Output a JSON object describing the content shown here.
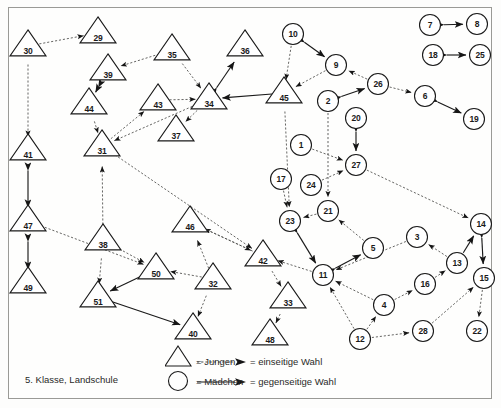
{
  "caption": "5. Klasse, Landschule",
  "legend": {
    "boys_label": "= Jungen",
    "girls_label": "= Mädchen",
    "one_sided_label": "= einseitige Wahl",
    "mutual_label": "= gegenseitige Wahl",
    "boys_icon": "triangle-icon",
    "girls_icon": "circle-icon",
    "one_sided_icon": "dashed-arrow-icon",
    "mutual_icon": "solid-arrow-icon"
  },
  "colors": {
    "stroke": "#1a1a1a",
    "frame": "#9a9a96",
    "background": "#fefefd",
    "edge": "#4a4a48"
  },
  "chart_data": {
    "type": "diagram",
    "title": "5. Klasse, Landschule",
    "node_shapes": {
      "triangle": "Jungen",
      "circle": "Mädchen"
    },
    "edge_styles": {
      "dashed": "einseitige Wahl",
      "solid": "gegenseitige Wahl"
    },
    "nodes": [
      {
        "id": "30",
        "shape": "triangle",
        "x": 28,
        "y": 46
      },
      {
        "id": "29",
        "shape": "triangle",
        "x": 98,
        "y": 33
      },
      {
        "id": "39",
        "shape": "triangle",
        "x": 108,
        "y": 70
      },
      {
        "id": "44",
        "shape": "triangle",
        "x": 89,
        "y": 104
      },
      {
        "id": "41",
        "shape": "triangle",
        "x": 28,
        "y": 150
      },
      {
        "id": "31",
        "shape": "triangle",
        "x": 102,
        "y": 146
      },
      {
        "id": "47",
        "shape": "triangle",
        "x": 28,
        "y": 221
      },
      {
        "id": "49",
        "shape": "triangle",
        "x": 28,
        "y": 283
      },
      {
        "id": "38",
        "shape": "triangle",
        "x": 103,
        "y": 240
      },
      {
        "id": "51",
        "shape": "triangle",
        "x": 98,
        "y": 297
      },
      {
        "id": "50",
        "shape": "triangle",
        "x": 156,
        "y": 269
      },
      {
        "id": "35",
        "shape": "triangle",
        "x": 172,
        "y": 50
      },
      {
        "id": "36",
        "shape": "triangle",
        "x": 245,
        "y": 46
      },
      {
        "id": "43",
        "shape": "triangle",
        "x": 158,
        "y": 100
      },
      {
        "id": "34",
        "shape": "triangle",
        "x": 209,
        "y": 99
      },
      {
        "id": "37",
        "shape": "triangle",
        "x": 176,
        "y": 131
      },
      {
        "id": "46",
        "shape": "triangle",
        "x": 190,
        "y": 222
      },
      {
        "id": "32",
        "shape": "triangle",
        "x": 213,
        "y": 279
      },
      {
        "id": "40",
        "shape": "triangle",
        "x": 193,
        "y": 329
      },
      {
        "id": "42",
        "shape": "triangle",
        "x": 263,
        "y": 256
      },
      {
        "id": "33",
        "shape": "triangle",
        "x": 288,
        "y": 298
      },
      {
        "id": "48",
        "shape": "triangle",
        "x": 270,
        "y": 335
      },
      {
        "id": "45",
        "shape": "triangle",
        "x": 284,
        "y": 93
      },
      {
        "id": "10",
        "shape": "circle",
        "x": 293,
        "y": 34
      },
      {
        "id": "9",
        "shape": "circle",
        "x": 336,
        "y": 65
      },
      {
        "id": "26",
        "shape": "circle",
        "x": 378,
        "y": 84
      },
      {
        "id": "2",
        "shape": "circle",
        "x": 328,
        "y": 101
      },
      {
        "id": "20",
        "shape": "circle",
        "x": 356,
        "y": 118
      },
      {
        "id": "6",
        "shape": "circle",
        "x": 425,
        "y": 96
      },
      {
        "id": "19",
        "shape": "circle",
        "x": 474,
        "y": 119
      },
      {
        "id": "7",
        "shape": "circle",
        "x": 430,
        "y": 25
      },
      {
        "id": "8",
        "shape": "circle",
        "x": 477,
        "y": 24
      },
      {
        "id": "18",
        "shape": "circle",
        "x": 433,
        "y": 55
      },
      {
        "id": "25",
        "shape": "circle",
        "x": 480,
        "y": 55
      },
      {
        "id": "1",
        "shape": "circle",
        "x": 301,
        "y": 145
      },
      {
        "id": "27",
        "shape": "circle",
        "x": 356,
        "y": 165
      },
      {
        "id": "17",
        "shape": "circle",
        "x": 281,
        "y": 179
      },
      {
        "id": "24",
        "shape": "circle",
        "x": 311,
        "y": 185
      },
      {
        "id": "21",
        "shape": "circle",
        "x": 328,
        "y": 211
      },
      {
        "id": "23",
        "shape": "circle",
        "x": 290,
        "y": 221
      },
      {
        "id": "5",
        "shape": "circle",
        "x": 373,
        "y": 248
      },
      {
        "id": "11",
        "shape": "circle",
        "x": 323,
        "y": 275
      },
      {
        "id": "3",
        "shape": "circle",
        "x": 417,
        "y": 237
      },
      {
        "id": "13",
        "shape": "circle",
        "x": 457,
        "y": 263
      },
      {
        "id": "14",
        "shape": "circle",
        "x": 481,
        "y": 224
      },
      {
        "id": "15",
        "shape": "circle",
        "x": 484,
        "y": 278
      },
      {
        "id": "22",
        "shape": "circle",
        "x": 477,
        "y": 331
      },
      {
        "id": "16",
        "shape": "circle",
        "x": 425,
        "y": 284
      },
      {
        "id": "4",
        "shape": "circle",
        "x": 384,
        "y": 305
      },
      {
        "id": "12",
        "shape": "circle",
        "x": 360,
        "y": 339
      },
      {
        "id": "28",
        "shape": "circle",
        "x": 423,
        "y": 331
      }
    ],
    "edges": [
      {
        "from": "30",
        "to": "29",
        "style": "dashed",
        "dir": "one"
      },
      {
        "from": "30",
        "to": "41",
        "style": "dashed",
        "dir": "one"
      },
      {
        "from": "41",
        "to": "47",
        "style": "solid",
        "dir": "both"
      },
      {
        "from": "47",
        "to": "49",
        "style": "solid",
        "dir": "both"
      },
      {
        "from": "35",
        "to": "39",
        "style": "dashed",
        "dir": "one"
      },
      {
        "from": "39",
        "to": "44",
        "style": "solid",
        "dir": "both"
      },
      {
        "from": "44",
        "to": "31",
        "style": "dashed",
        "dir": "one"
      },
      {
        "from": "35",
        "to": "34",
        "style": "dashed",
        "dir": "one"
      },
      {
        "from": "43",
        "to": "34",
        "style": "dashed",
        "dir": "one"
      },
      {
        "from": "34",
        "to": "31",
        "style": "dashed",
        "dir": "one"
      },
      {
        "from": "31",
        "to": "43",
        "style": "dashed",
        "dir": "one"
      },
      {
        "from": "34",
        "to": "37",
        "style": "dashed",
        "dir": "one"
      },
      {
        "from": "34",
        "to": "36",
        "style": "solid",
        "dir": "both"
      },
      {
        "from": "45",
        "to": "34",
        "style": "solid",
        "dir": "one"
      },
      {
        "from": "38",
        "to": "31",
        "style": "dashed",
        "dir": "one"
      },
      {
        "from": "47",
        "to": "50",
        "style": "dashed",
        "dir": "one"
      },
      {
        "from": "38",
        "to": "51",
        "style": "dashed",
        "dir": "one"
      },
      {
        "from": "38",
        "to": "50",
        "style": "dashed",
        "dir": "one"
      },
      {
        "from": "50",
        "to": "51",
        "style": "solid",
        "dir": "both"
      },
      {
        "from": "51",
        "to": "40",
        "style": "solid",
        "dir": "both"
      },
      {
        "from": "32",
        "to": "50",
        "style": "dashed",
        "dir": "one"
      },
      {
        "from": "32",
        "to": "40",
        "style": "dashed",
        "dir": "one"
      },
      {
        "from": "32",
        "to": "46",
        "style": "dashed",
        "dir": "one"
      },
      {
        "from": "42",
        "to": "46",
        "style": "dashed",
        "dir": "one"
      },
      {
        "from": "31",
        "to": "42",
        "style": "dashed",
        "dir": "one"
      },
      {
        "from": "46",
        "to": "42",
        "style": "dashed",
        "dir": "one"
      },
      {
        "from": "42",
        "to": "33",
        "style": "dashed",
        "dir": "one"
      },
      {
        "from": "33",
        "to": "48",
        "style": "dashed",
        "dir": "one"
      },
      {
        "from": "11",
        "to": "42",
        "style": "dashed",
        "dir": "one"
      },
      {
        "from": "10",
        "to": "9",
        "style": "solid",
        "dir": "both"
      },
      {
        "from": "10",
        "to": "45",
        "style": "dashed",
        "dir": "one"
      },
      {
        "from": "9",
        "to": "45",
        "style": "dashed",
        "dir": "one"
      },
      {
        "from": "26",
        "to": "9",
        "style": "dashed",
        "dir": "one"
      },
      {
        "from": "2",
        "to": "26",
        "style": "solid",
        "dir": "both"
      },
      {
        "from": "26",
        "to": "6",
        "style": "dashed",
        "dir": "one"
      },
      {
        "from": "6",
        "to": "19",
        "style": "solid",
        "dir": "both"
      },
      {
        "from": "7",
        "to": "8",
        "style": "solid",
        "dir": "both"
      },
      {
        "from": "18",
        "to": "25",
        "style": "solid",
        "dir": "both"
      },
      {
        "from": "20",
        "to": "27",
        "style": "solid",
        "dir": "both"
      },
      {
        "from": "1",
        "to": "27",
        "style": "dashed",
        "dir": "one"
      },
      {
        "from": "24",
        "to": "27",
        "style": "dashed",
        "dir": "one"
      },
      {
        "from": "2",
        "to": "21",
        "style": "dashed",
        "dir": "one"
      },
      {
        "from": "17",
        "to": "23",
        "style": "dashed",
        "dir": "one"
      },
      {
        "from": "21",
        "to": "23",
        "style": "dashed",
        "dir": "one"
      },
      {
        "from": "45",
        "to": "23",
        "style": "dashed",
        "dir": "one"
      },
      {
        "from": "23",
        "to": "11",
        "style": "solid",
        "dir": "both"
      },
      {
        "from": "11",
        "to": "5",
        "style": "solid",
        "dir": "both"
      },
      {
        "from": "5",
        "to": "21",
        "style": "dashed",
        "dir": "one"
      },
      {
        "from": "3",
        "to": "11",
        "style": "dashed",
        "dir": "one"
      },
      {
        "from": "4",
        "to": "11",
        "style": "dashed",
        "dir": "one"
      },
      {
        "from": "12",
        "to": "11",
        "style": "dashed",
        "dir": "one"
      },
      {
        "from": "12",
        "to": "4",
        "style": "dashed",
        "dir": "one"
      },
      {
        "from": "4",
        "to": "16",
        "style": "dashed",
        "dir": "one"
      },
      {
        "from": "16",
        "to": "13",
        "style": "dashed",
        "dir": "one"
      },
      {
        "from": "13",
        "to": "3",
        "style": "dashed",
        "dir": "one"
      },
      {
        "from": "13",
        "to": "14",
        "style": "solid",
        "dir": "one"
      },
      {
        "from": "27",
        "to": "14",
        "style": "dashed",
        "dir": "one"
      },
      {
        "from": "14",
        "to": "15",
        "style": "solid",
        "dir": "both"
      },
      {
        "from": "15",
        "to": "22",
        "style": "dashed",
        "dir": "one"
      },
      {
        "from": "12",
        "to": "28",
        "style": "dashed",
        "dir": "one"
      },
      {
        "from": "28",
        "to": "15",
        "style": "dashed",
        "dir": "one"
      }
    ]
  }
}
